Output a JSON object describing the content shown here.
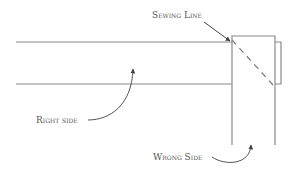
{
  "diagram": {
    "labels": {
      "sewing_line": "Sewing Line",
      "right_side": "Right side",
      "wrong_side": "Wrong Side"
    },
    "colors": {
      "line": "#8a8a8a",
      "arrow": "#555555",
      "text": "#555555",
      "background": "#ffffff"
    }
  }
}
